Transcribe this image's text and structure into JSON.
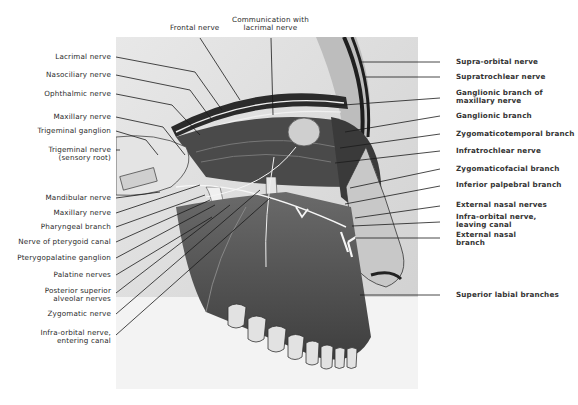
{
  "figure": {
    "top_labels": [
      {
        "text": "Frontal nerve"
      },
      {
        "text": "Communication with\nlacrimal nerve"
      }
    ],
    "left_labels": [
      {
        "text": "Lacrimal nerve"
      },
      {
        "text": "Nasociliary nerve"
      },
      {
        "text": "Ophthalmic nerve"
      },
      {
        "text": "Maxillary nerve"
      },
      {
        "text": "Trigeminal ganglion"
      },
      {
        "text": "Trigeminal nerve\n(sensory root)"
      },
      {
        "text": "Mandibular nerve"
      },
      {
        "text": "Maxillary nerve"
      },
      {
        "text": "Pharyngeal branch"
      },
      {
        "text": "Nerve of pterygoid canal"
      },
      {
        "text": "Pterygopalatine ganglion"
      },
      {
        "text": "Palatine nerves"
      },
      {
        "text": "Posterior superior\nalveolar nerves"
      },
      {
        "text": "Zygomatic nerve"
      },
      {
        "text": "Infra-orbital nerve,\nentering canal"
      }
    ],
    "right_labels": [
      {
        "text": "Supra-orbital nerve"
      },
      {
        "text": "Supratrochlear nerve"
      },
      {
        "text": "Ganglionic branch of\nmaxillary nerve"
      },
      {
        "text": "Ganglionic branch"
      },
      {
        "text": "Zygomaticotemporal branch"
      },
      {
        "text": "Infratrochlear nerve"
      },
      {
        "text": "Zygomaticofacial branch"
      },
      {
        "text": "Inferior palpebral branch"
      },
      {
        "text": "External nasal nerves"
      },
      {
        "text": "Infra-orbital nerve,\nleaving canal"
      },
      {
        "text": "External nasal\nbranch"
      },
      {
        "text": "Superior labial branches"
      }
    ],
    "colors": {
      "background": "#ffffff",
      "label_text": "#2a2a2a",
      "leader_line": "#1a1a1a",
      "illustration_base": "#d9d9d9",
      "bone_dark": "#5a5a5a",
      "nerve": "#f4f4f4"
    }
  }
}
